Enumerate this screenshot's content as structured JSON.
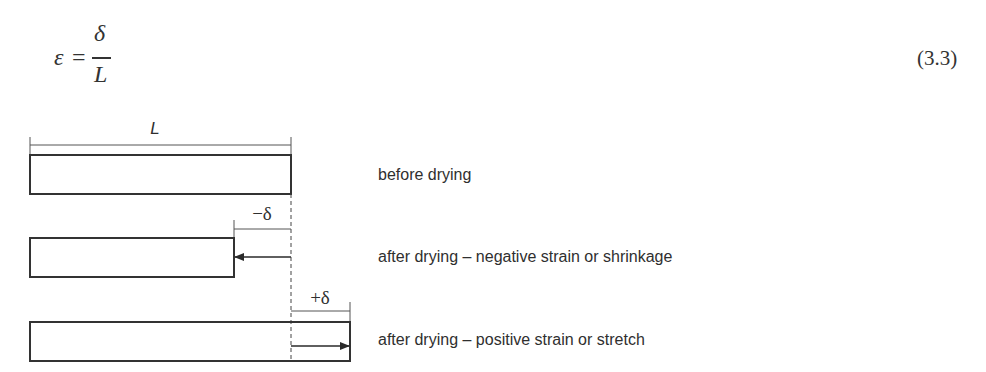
{
  "equation": {
    "lhs": "ε",
    "operator": "=",
    "numerator": "δ",
    "denominator": "L",
    "number": "(3.3)"
  },
  "diagram": {
    "dimension_labels": {
      "length": "L",
      "shrinkage": "−δ",
      "stretch": "+δ"
    },
    "states": [
      {
        "id": "before",
        "label": "before drying"
      },
      {
        "id": "shrinkage",
        "label": "after drying – negative strain or shrinkage"
      },
      {
        "id": "stretch",
        "label": "after drying – positive strain or stretch"
      }
    ],
    "colors": {
      "stroke": "#333333",
      "background": "#ffffff"
    }
  }
}
